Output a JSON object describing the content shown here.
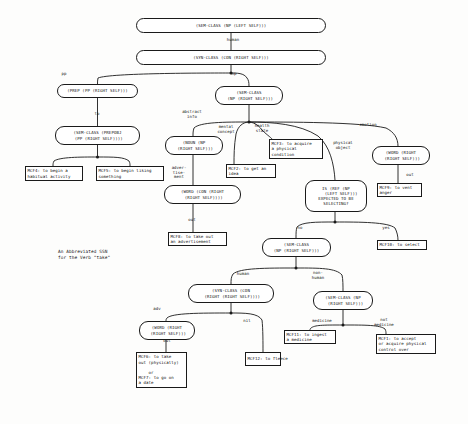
{
  "figure": {
    "caption": "An Abbreviated SSN\nfor the Verb \"take\"",
    "ink_color": "#1a1a1a",
    "background_color": "#fdfdfc"
  },
  "nodes": [
    {
      "id": "n_root",
      "kind": "decision",
      "text": "(SEM-CLASS (NP (LEFT SELF)))",
      "x": 136,
      "y": 18,
      "w": 190,
      "h": 15
    },
    {
      "id": "n_syn_con",
      "kind": "decision",
      "text": "(SYN-CLASS (CON (RIGHT SELF)))",
      "x": 136,
      "y": 50,
      "w": 190,
      "h": 15
    },
    {
      "id": "n_prep",
      "kind": "decision",
      "text": "(PREP (PP (RIGHT SELF)))",
      "x": 57,
      "y": 84,
      "w": 81,
      "h": 14
    },
    {
      "id": "n_prepobj",
      "kind": "decision",
      "text": "(SEM-CLASS (PREPOBJ\n (PP (RIGHT SELF))))",
      "x": 55,
      "y": 126,
      "w": 85,
      "h": 19
    },
    {
      "id": "n_sem_np_1",
      "kind": "decision",
      "text": "(SEM-CLASS\n (NP (RIGHT SELF)))",
      "x": 215,
      "y": 86,
      "w": 68,
      "h": 19
    },
    {
      "id": "n_noun_np",
      "kind": "decision",
      "text": "(NOUN (NP\n (RIGHT SELF)))",
      "x": 165,
      "y": 136,
      "w": 58,
      "h": 19
    },
    {
      "id": "n_word_con",
      "kind": "decision",
      "text": "(WORD (CON (RIGHT\n (RIGHT SELF))))",
      "x": 164,
      "y": 185,
      "w": 77,
      "h": 19
    },
    {
      "id": "n_word_right",
      "kind": "decision",
      "text": "(WORD (RIGHT\n (RIGHT SELF)))",
      "x": 372,
      "y": 146,
      "w": 58,
      "h": 19
    },
    {
      "id": "n_is_ref",
      "kind": "decision",
      "text": "IS (REF (NP\n    (LEFT SELF)))\nEXPECTED TO BE\nSELECTING?",
      "x": 305,
      "y": 180,
      "w": 62,
      "h": 32
    },
    {
      "id": "n_sem_np_2",
      "kind": "decision",
      "text": "(SEM-CLASS\n(NP (RIGHT SELF)))",
      "x": 262,
      "y": 238,
      "w": 69,
      "h": 19
    },
    {
      "id": "n_syn_con_2",
      "kind": "decision",
      "text": "(SYN-CLASS (CON\n (RIGHT (RIGHT SELF))))",
      "x": 188,
      "y": 284,
      "w": 86,
      "h": 19
    },
    {
      "id": "n_sem_np_3",
      "kind": "decision",
      "text": "(SEM-CLASS (NP\n  (RIGHT SELF)))",
      "x": 313,
      "y": 291,
      "w": 60,
      "h": 19
    },
    {
      "id": "n_word_right_2",
      "kind": "decision",
      "text": "(WORD (RIGHT\n (RIGHT SELF)))",
      "x": 139,
      "y": 321,
      "w": 56,
      "h": 19
    },
    {
      "id": "l_mcf4",
      "kind": "leaf",
      "text": "MCF4: to begin a\nhabitual activity",
      "x": 25,
      "y": 166,
      "w": 58,
      "h": 15
    },
    {
      "id": "l_mcf5",
      "kind": "leaf",
      "text": "MCF5: to begin liking\nsomething",
      "x": 96,
      "y": 166,
      "w": 68,
      "h": 15
    },
    {
      "id": "l_mcf2",
      "kind": "leaf",
      "text": "MCF2: to get an\nidea",
      "x": 226,
      "y": 164,
      "w": 50,
      "h": 14
    },
    {
      "id": "l_mcf3",
      "kind": "leaf",
      "text": "MCF3: to acquire\na physical\ncondition",
      "x": 269,
      "y": 139,
      "w": 54,
      "h": 20
    },
    {
      "id": "l_mcf9",
      "kind": "leaf",
      "text": "MCF9: to vent\nanger",
      "x": 377,
      "y": 183,
      "w": 45,
      "h": 14
    },
    {
      "id": "l_mcf8",
      "kind": "leaf",
      "text": "MCF8: to take out\nan advertisement",
      "x": 168,
      "y": 232,
      "w": 59,
      "h": 14
    },
    {
      "id": "l_mcf10",
      "kind": "leaf",
      "text": "MCF10: to select",
      "x": 377,
      "y": 240,
      "w": 50,
      "h": 10
    },
    {
      "id": "l_mcf6",
      "kind": "leaf",
      "text": "MCF6: to take\nout (physically)\n\n    or\nMCF7: to go on\na date",
      "x": 136,
      "y": 352,
      "w": 51,
      "h": 36
    },
    {
      "id": "l_mcf12",
      "kind": "leaf",
      "text": "MCF12: to fleece",
      "x": 245,
      "y": 352,
      "w": 36,
      "h": 14
    },
    {
      "id": "l_mcf11",
      "kind": "leaf",
      "text": "MCF11: to ingest\na medicine",
      "x": 284,
      "y": 330,
      "w": 52,
      "h": 14
    },
    {
      "id": "l_mcf1",
      "kind": "leaf",
      "text": "MCF1: to accept\nor acquire physical\ncontrol over",
      "x": 376,
      "y": 334,
      "w": 60,
      "h": 20
    }
  ],
  "edge_labels": [
    {
      "id": "e_human_top",
      "text": "human",
      "x": 218,
      "y": 38,
      "w": 30
    },
    {
      "id": "e_pp",
      "text": "pp",
      "x": 57,
      "y": 72,
      "w": 14
    },
    {
      "id": "e_np",
      "text": "np",
      "x": 227,
      "y": 72,
      "w": 14
    },
    {
      "id": "e_to",
      "text": "to",
      "x": 90,
      "y": 112,
      "w": 14
    },
    {
      "id": "e_abstract",
      "text": "abstract\ninfo",
      "x": 176,
      "y": 110,
      "w": 32
    },
    {
      "id": "e_mental",
      "text": "mental\nconcept",
      "x": 211,
      "y": 125,
      "w": 30
    },
    {
      "id": "e_health",
      "text": "health\nstate",
      "x": 248,
      "y": 124,
      "w": 28
    },
    {
      "id": "e_physical",
      "text": "physical\nobject",
      "x": 327,
      "y": 141,
      "w": 32
    },
    {
      "id": "e_emotion",
      "text": "emotion",
      "x": 352,
      "y": 123,
      "w": 32
    },
    {
      "id": "e_advert",
      "text": "adver-\ntise-\nment",
      "x": 167,
      "y": 166,
      "w": 24
    },
    {
      "id": "e_out_1",
      "text": "out",
      "x": 185,
      "y": 218,
      "w": 14
    },
    {
      "id": "e_out_2",
      "text": "out",
      "x": 403,
      "y": 173,
      "w": 14
    },
    {
      "id": "e_no_1",
      "text": "no",
      "x": 293,
      "y": 226,
      "w": 14
    },
    {
      "id": "e_yes",
      "text": "yes",
      "x": 379,
      "y": 226,
      "w": 14
    },
    {
      "id": "e_human_low",
      "text": "human",
      "x": 229,
      "y": 272,
      "w": 28
    },
    {
      "id": "e_nonhuman",
      "text": "non-\nhuman",
      "x": 307,
      "y": 271,
      "w": 22
    },
    {
      "id": "e_adv",
      "text": "adv",
      "x": 150,
      "y": 307,
      "w": 14
    },
    {
      "id": "e_nil",
      "text": "nil",
      "x": 240,
      "y": 319,
      "w": 14
    },
    {
      "id": "e_medicine",
      "text": "medicine",
      "x": 306,
      "y": 319,
      "w": 32
    },
    {
      "id": "e_notmed",
      "text": "not\nmedicine",
      "x": 370,
      "y": 318,
      "w": 28
    },
    {
      "id": "e_out_3",
      "text": "out",
      "x": 160,
      "y": 339,
      "w": 14
    }
  ],
  "connectors": [
    {
      "id": "c_root_syn",
      "path": "M231,33 L231,50"
    },
    {
      "id": "c_syn_junction",
      "path": "M231,65 L231,73"
    },
    {
      "id": "c_syn_pp",
      "path": "M231,73 C205,73 110,73 98,78 C97.5,80 97.5,82 97.5,84"
    },
    {
      "id": "c_syn_np",
      "path": "M231,73 C237,73 244,73 247,78 C248.5,80 249,82 249,86"
    },
    {
      "id": "c_prep_prepobj",
      "path": "M97.5,98 L97.5,126"
    },
    {
      "id": "c_prepobj_junc",
      "path": "M97.5,145 L97.5,157"
    },
    {
      "id": "c_prepobj_mcf4",
      "path": "M97.5,157 C80,157 60,157 54,161 C53,163 53,164 53,166"
    },
    {
      "id": "c_prepobj_mcf5",
      "path": "M97.5,157 C115,157 124,157 129,161 C130,163 130,164 130,166"
    },
    {
      "id": "c_np_junction",
      "path": "M249,105 L249,122"
    },
    {
      "id": "c_np_abstract",
      "path": "M249,122 C225,122 200,122 194,128 C193,131 193,133 193,136"
    },
    {
      "id": "c_np_mental",
      "path": "M249,122 C243,122 238,126 236,134 C234,146 234,156 234,164"
    },
    {
      "id": "c_np_health",
      "path": "M249,122 C252,122 258,124 262,130 C268,136 272,138 272,139"
    },
    {
      "id": "c_np_physical",
      "path": "M249,122 C272,122 300,124 318,136 C330,146 334,164 335,180"
    },
    {
      "id": "c_np_emotion",
      "path": "M249,122 C290,122 360,122 386,128 C394,132 398,138 398,146"
    },
    {
      "id": "c_noun_word",
      "path": "M193,155 L193,185"
    },
    {
      "id": "c_word_mcf8",
      "path": "M193,204 L193,232"
    },
    {
      "id": "c_wordright_mcf9",
      "path": "M398,165 L398,183"
    },
    {
      "id": "c_isref_junc",
      "path": "M335,212 L335,222"
    },
    {
      "id": "c_isref_no",
      "path": "M335,222 C315,222 302,222 297,227 C296,230 296,233 296,238"
    },
    {
      "id": "c_isref_yes",
      "path": "M335,222 C360,222 388,222 395,228 C397,232 398,236 398,240"
    },
    {
      "id": "c_sem2_junc",
      "path": "M296,257 L296,268"
    },
    {
      "id": "c_sem2_human",
      "path": "M296,268 C265,268 240,268 233,274 C231,277 231,280 231,284"
    },
    {
      "id": "c_sem2_nonhuman",
      "path": "M296,268 C320,268 336,268 342,275 C343,279 343,286 343,291"
    },
    {
      "id": "c_syn2_junc",
      "path": "M231,303 L231,313"
    },
    {
      "id": "c_syn2_adv",
      "path": "M231,313 C200,313 172,313 167,318 C166,319 166,320 166,321"
    },
    {
      "id": "c_syn2_nil",
      "path": "M231,313 C245,313 258,313 262,320 C263,328 263,344 263,352"
    },
    {
      "id": "c_word3_mcf6",
      "path": "M166,340 L166,352"
    },
    {
      "id": "c_sem3_junc",
      "path": "M343,310 L343,325"
    },
    {
      "id": "c_sem3_medicine",
      "path": "M343,325 C322,325 315,325 311,328 C310,329 310,329 310,330"
    },
    {
      "id": "c_sem3_notmed",
      "path": "M343,325 C366,325 380,325 385,329 C386,331 386,332 386,334"
    }
  ],
  "junction_dots": [
    {
      "id": "d_syn",
      "x": 231,
      "y": 73
    },
    {
      "id": "d_prep",
      "x": 97.5,
      "y": 157
    },
    {
      "id": "d_np",
      "x": 249,
      "y": 122
    },
    {
      "id": "d_isref",
      "x": 335,
      "y": 222
    },
    {
      "id": "d_sem2",
      "x": 296,
      "y": 268
    },
    {
      "id": "d_syn2",
      "x": 231,
      "y": 313
    },
    {
      "id": "d_sem3",
      "x": 343,
      "y": 325
    }
  ]
}
